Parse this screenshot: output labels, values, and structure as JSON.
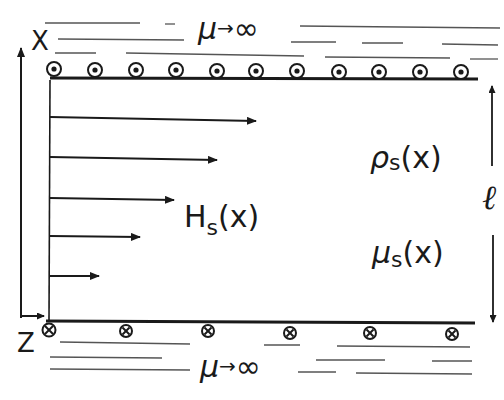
{
  "diagram": {
    "title": "",
    "axes": {
      "x_label": "X",
      "z_label": "Z"
    },
    "regions": {
      "top_medium": {
        "symbol": "μ",
        "arrow": "→",
        "value": "∞"
      },
      "bottom_medium": {
        "symbol": "μ",
        "arrow": "→",
        "value": "∞"
      }
    },
    "slab": {
      "field": {
        "symbol": "H",
        "subscript": "s",
        "arg": "(x)"
      },
      "charge_density": {
        "symbol": "ρ",
        "subscript": "s",
        "arg": "(x)"
      },
      "permeability": {
        "symbol": "μ",
        "subscript": "s",
        "arg": "(x)"
      },
      "thickness_label": "ℓ"
    },
    "currents": {
      "top": {
        "direction": "out-of-page",
        "icon": "dot-circle-icon",
        "count": 11
      },
      "bottom": {
        "direction": "into-page",
        "icon": "cross-circle-icon",
        "count": 6
      }
    },
    "field_arrows": {
      "count": 5,
      "lengths_px": [
        205,
        167,
        124,
        90,
        48
      ]
    },
    "colors": {
      "ink": "#1a1a1a",
      "hatch": "#555555",
      "background": "#ffffff"
    }
  }
}
